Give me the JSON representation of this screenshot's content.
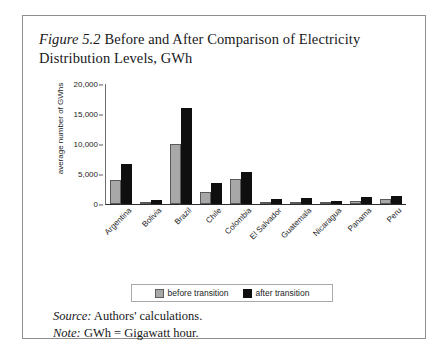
{
  "figure": {
    "number_label": "Figure 5.2",
    "title_text": " Before and After Comparison of Electricity Distribution Levels, GWh"
  },
  "notes": {
    "source_lead": "Source:",
    "source_text": " Authors' calculations.",
    "note_lead": "Note:",
    "note_text": " GWh = Gigawatt hour."
  },
  "legend": {
    "before_label": "before transition",
    "after_label": "after transition"
  },
  "colors": {
    "before": "#a8a8a8",
    "after": "#0f0f10",
    "axis": "#2b2c2e",
    "border": "#8e8e8e"
  },
  "chart_data": {
    "type": "bar",
    "title": "Figure 5.2 Before and After Comparison of Electricity Distribution Levels, GWh",
    "xlabel": "",
    "ylabel": "average number of GWhs",
    "ylim": [
      0,
      20000
    ],
    "ytick_labels": [
      "20,000",
      "15,000",
      "10,000",
      "5,000",
      "0"
    ],
    "ytick_values": [
      20000,
      15000,
      10000,
      5000,
      0
    ],
    "grid": false,
    "legend_position": "bottom",
    "categories": [
      "Argentina",
      "Bolivia",
      "Brazil",
      "Chile",
      "Colombia",
      "El Salvador",
      "Guatemala",
      "Nicaragua",
      "Panama",
      "Peru"
    ],
    "series": [
      {
        "name": "before transition",
        "color": "#a8a8a8",
        "values": [
          4000,
          300,
          10000,
          2000,
          4200,
          400,
          300,
          200,
          500,
          800
        ]
      },
      {
        "name": "after transition",
        "color": "#0f0f10",
        "values": [
          6600,
          700,
          16000,
          3500,
          5300,
          900,
          1000,
          500,
          1200,
          1400
        ]
      }
    ]
  }
}
